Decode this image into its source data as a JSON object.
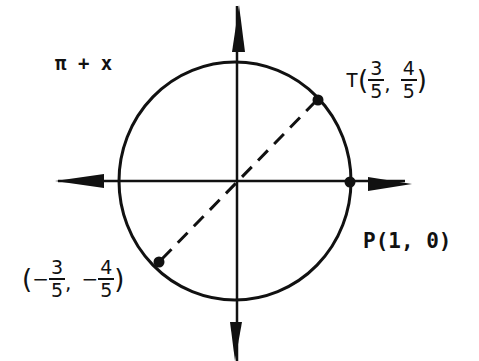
{
  "diagram": {
    "title_label": "π + x",
    "point_T": {
      "name": "T",
      "x": {
        "numerator": "3",
        "denominator": "5"
      },
      "y": {
        "numerator": "4",
        "denominator": "5"
      }
    },
    "point_P": {
      "label": "P(1, 0)"
    },
    "point_opposite": {
      "x": {
        "sign": "−",
        "numerator": "3",
        "denominator": "5"
      },
      "y": {
        "sign": "−",
        "numerator": "4",
        "denominator": "5"
      }
    },
    "colors": {
      "stroke": "#111111",
      "background": "#ffffff"
    }
  }
}
